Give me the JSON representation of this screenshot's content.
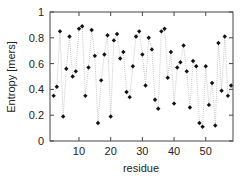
{
  "chart_data": {
    "type": "line",
    "title": "",
    "xlabel": "residue",
    "ylabel": "Entropy [mers]",
    "xlim": [
      0.85,
      58.6
    ],
    "ylim": [
      0,
      1
    ],
    "xticks": [
      10,
      20,
      30,
      40,
      50
    ],
    "yticks": [
      0,
      0.2,
      0.4,
      0.6,
      0.8,
      1
    ],
    "ytick_labels": [
      "0",
      "0.2",
      "0.4",
      "0.6",
      "0.8",
      "1"
    ],
    "grid": false,
    "legend": null,
    "marker": "diamond",
    "line_style": "dotted",
    "x": [
      2,
      3,
      4,
      5,
      6,
      7,
      8,
      9,
      10,
      11,
      12,
      13,
      14,
      15,
      16,
      17,
      18,
      19,
      20,
      21,
      22,
      23,
      24,
      25,
      26,
      27,
      28,
      29,
      30,
      31,
      32,
      33,
      34,
      35,
      36,
      37,
      38,
      39,
      40,
      41,
      42,
      43,
      44,
      45,
      46,
      47,
      48,
      49,
      50,
      51,
      52,
      53,
      54,
      55,
      56,
      57,
      58
    ],
    "y": [
      0.35,
      0.42,
      0.85,
      0.19,
      0.56,
      0.81,
      0.5,
      0.54,
      0.87,
      0.89,
      0.35,
      0.57,
      0.86,
      0.66,
      0.14,
      0.47,
      0.67,
      0.82,
      0.19,
      0.78,
      0.83,
      0.64,
      0.69,
      0.38,
      0.34,
      0.58,
      0.81,
      0.85,
      0.67,
      0.43,
      0.8,
      0.71,
      0.32,
      0.25,
      0.85,
      0.87,
      0.49,
      0.69,
      0.29,
      0.57,
      0.61,
      0.74,
      0.54,
      0.26,
      0.62,
      0.58,
      0.14,
      0.11,
      0.58,
      0.28,
      0.45,
      0.12,
      0.76,
      0.39,
      0.81,
      0.35,
      0.43
    ]
  },
  "colors": {
    "axis": "#444444",
    "marker": "#111111",
    "line": "#bbbbbb",
    "background": "#ffffff"
  }
}
